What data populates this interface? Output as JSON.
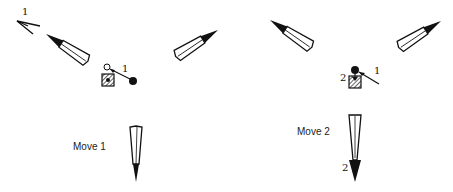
{
  "panels": [
    {
      "caption": "Move 1",
      "labels": {
        "top_left_arrow": "1",
        "near_stone": "1"
      }
    },
    {
      "caption": "Move 2",
      "labels": {
        "near_stone_left": "2",
        "near_stone_right": "1",
        "bottom_arrow": "2"
      }
    }
  ],
  "colors": {
    "ink": "#111111",
    "background": "#ffffff"
  }
}
